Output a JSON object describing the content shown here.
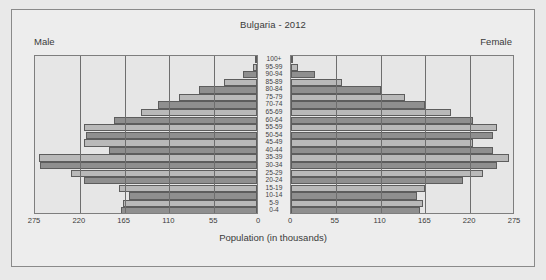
{
  "figure": {
    "title": "Bulgaria - 2012",
    "male_label": "Male",
    "female_label": "Female",
    "xaxis_title": "Population (in thousands)"
  },
  "chart_data": {
    "type": "bar",
    "subtype": "population-pyramid",
    "title": "Bulgaria - 2012",
    "xlabel": "Population (in thousands)",
    "ylabel": "",
    "xlim": [
      0,
      275
    ],
    "xticks": [
      275,
      220,
      165,
      110,
      55,
      0
    ],
    "xticks_right": [
      0,
      55,
      110,
      165,
      220,
      275
    ],
    "grid": true,
    "legend": [
      "Male",
      "Female"
    ],
    "legend_position": "top-left and top-right corners",
    "categories": [
      "100+",
      "95-99",
      "90-94",
      "85-89",
      "80-84",
      "75-79",
      "70-74",
      "65-69",
      "60-64",
      "55-59",
      "50-54",
      "45-49",
      "40-44",
      "35-39",
      "30-34",
      "25-29",
      "20-24",
      "15-19",
      "10-14",
      "5-9",
      "0-4"
    ],
    "series": [
      {
        "name": "Male",
        "side": "left",
        "values": [
          1,
          5,
          17,
          40,
          71,
          96,
          121,
          143,
          176,
          212,
          210,
          212,
          182,
          268,
          266,
          228,
          212,
          170,
          157,
          164,
          167
        ]
      },
      {
        "name": "Female",
        "side": "right",
        "values": [
          2,
          9,
          30,
          62,
          110,
          140,
          165,
          196,
          224,
          253,
          248,
          224,
          248,
          268,
          253,
          236,
          211,
          165,
          155,
          162,
          158
        ]
      }
    ],
    "bar_colors": {
      "dark": "#8f8f8f",
      "light": "#b9b9b9",
      "edge": "#5d5d5d"
    },
    "panel_background": "#e6e6e6",
    "figure_background": "#ededed"
  }
}
